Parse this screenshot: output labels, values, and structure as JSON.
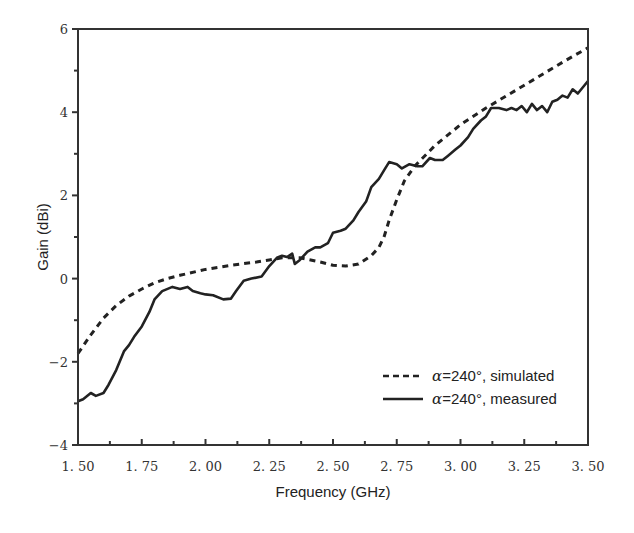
{
  "chart_data": {
    "type": "line",
    "title": "",
    "xlabel": "Frequency  (GHz)",
    "ylabel": "Gain  (dBi)",
    "xlim": [
      1.5,
      3.5
    ],
    "ylim": [
      -4,
      6
    ],
    "x_ticks": [
      "1.50",
      "1.75",
      "2.00",
      "2.25",
      "2.50",
      "2.75",
      "3.00",
      "3.25",
      "3.50"
    ],
    "y_ticks": [
      "-4",
      "-2",
      "0",
      "2",
      "4",
      "6"
    ],
    "grid": false,
    "legend_position": "lower right",
    "series": [
      {
        "name": "α=240°, simulated",
        "style": "dashed",
        "color": "#222222",
        "x": [
          1.5,
          1.55,
          1.6,
          1.65,
          1.7,
          1.75,
          1.8,
          1.85,
          1.9,
          2.0,
          2.1,
          2.2,
          2.25,
          2.3,
          2.37,
          2.45,
          2.5,
          2.55,
          2.6,
          2.65,
          2.68,
          2.7,
          2.72,
          2.75,
          2.78,
          2.82,
          2.9,
          3.0,
          3.1,
          3.25,
          3.4,
          3.5
        ],
        "y": [
          -1.8,
          -1.35,
          -0.95,
          -0.65,
          -0.42,
          -0.25,
          -0.1,
          0.0,
          0.08,
          0.22,
          0.32,
          0.4,
          0.45,
          0.5,
          0.5,
          0.4,
          0.32,
          0.3,
          0.35,
          0.55,
          0.75,
          1.0,
          1.4,
          1.9,
          2.35,
          2.7,
          3.2,
          3.7,
          4.1,
          4.65,
          5.2,
          5.55
        ]
      },
      {
        "name": "α=240°, measured",
        "style": "solid",
        "color": "#222222",
        "x": [
          1.5,
          1.52,
          1.55,
          1.57,
          1.6,
          1.62,
          1.65,
          1.68,
          1.7,
          1.72,
          1.75,
          1.78,
          1.8,
          1.83,
          1.87,
          1.9,
          1.93,
          1.95,
          1.98,
          2.0,
          2.03,
          2.07,
          2.1,
          2.12,
          2.15,
          2.18,
          2.22,
          2.25,
          2.28,
          2.3,
          2.32,
          2.34,
          2.35,
          2.37,
          2.4,
          2.43,
          2.45,
          2.48,
          2.5,
          2.53,
          2.55,
          2.58,
          2.6,
          2.63,
          2.65,
          2.68,
          2.7,
          2.72,
          2.75,
          2.77,
          2.8,
          2.83,
          2.85,
          2.88,
          2.9,
          2.93,
          2.95,
          2.98,
          3.0,
          3.03,
          3.05,
          3.08,
          3.1,
          3.12,
          3.15,
          3.18,
          3.2,
          3.22,
          3.24,
          3.26,
          3.28,
          3.3,
          3.32,
          3.34,
          3.36,
          3.38,
          3.4,
          3.42,
          3.44,
          3.46,
          3.48,
          3.5
        ],
        "y": [
          -2.95,
          -2.9,
          -2.75,
          -2.82,
          -2.75,
          -2.55,
          -2.2,
          -1.75,
          -1.6,
          -1.4,
          -1.15,
          -0.8,
          -0.5,
          -0.3,
          -0.2,
          -0.25,
          -0.2,
          -0.3,
          -0.35,
          -0.38,
          -0.4,
          -0.5,
          -0.48,
          -0.3,
          -0.05,
          0.0,
          0.05,
          0.3,
          0.5,
          0.55,
          0.52,
          0.6,
          0.35,
          0.45,
          0.65,
          0.75,
          0.75,
          0.85,
          1.1,
          1.15,
          1.2,
          1.4,
          1.6,
          1.85,
          2.2,
          2.4,
          2.6,
          2.8,
          2.75,
          2.65,
          2.75,
          2.7,
          2.7,
          2.9,
          2.85,
          2.85,
          2.95,
          3.1,
          3.2,
          3.4,
          3.6,
          3.8,
          3.9,
          4.1,
          4.1,
          4.05,
          4.1,
          4.05,
          4.15,
          4.0,
          4.2,
          4.05,
          4.15,
          4.0,
          4.25,
          4.3,
          4.4,
          4.35,
          4.55,
          4.45,
          4.6,
          4.75
        ]
      }
    ]
  },
  "legend": {
    "items": [
      {
        "alpha": "α",
        "label": "=240°, simulated",
        "style": "dashed"
      },
      {
        "alpha": "α",
        "label": "=240°, measured",
        "style": "solid"
      }
    ]
  }
}
